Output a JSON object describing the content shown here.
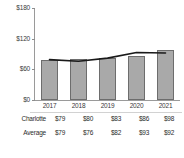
{
  "chart_data": {
    "type": "bar",
    "title": "",
    "xlabel": "",
    "ylabel": "",
    "categories": [
      "2017",
      "2018",
      "2019",
      "2020",
      "2021"
    ],
    "ylim": [
      0,
      180
    ],
    "yticks": [
      "$0",
      "$60",
      "$120",
      "$180"
    ],
    "ytick_values": [
      0,
      60,
      120,
      180
    ],
    "grid": false,
    "legend_position": "none",
    "series": [
      {
        "name": "Charlotte",
        "type": "bar",
        "color": "#a9a9a9",
        "values": [
          79,
          80,
          83,
          86,
          98
        ],
        "labels": [
          "$79",
          "$80",
          "$83",
          "$86",
          "$98"
        ]
      },
      {
        "name": "Average",
        "type": "line",
        "color": "#1a1a1a",
        "values": [
          79,
          76,
          82,
          93,
          92
        ],
        "labels": [
          "$79",
          "$76",
          "$82",
          "$93",
          "$92"
        ]
      }
    ]
  },
  "table": {
    "rows": [
      {
        "label": "Charlotte",
        "cells": [
          "$79",
          "$80",
          "$83",
          "$86",
          "$98"
        ]
      },
      {
        "label": "Average",
        "cells": [
          "$79",
          "$76",
          "$82",
          "$93",
          "$92"
        ]
      }
    ]
  }
}
